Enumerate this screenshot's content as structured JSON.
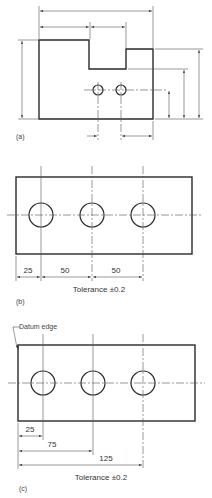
{
  "figure_a": {
    "label": "(a)",
    "description": "Stepped block with two holes, dimensions without values"
  },
  "figure_b": {
    "label": "(b)",
    "dimensions": [
      "25",
      "50",
      "50"
    ],
    "tolerance": "Tolerance ±0.2",
    "dimensioning_type": "chain"
  },
  "figure_c": {
    "label": "(c)",
    "datum_label": "Datum edge",
    "dimensions": [
      "25",
      "75",
      "125"
    ],
    "tolerance": "Tolerance ±0.2",
    "dimensioning_type": "datum"
  },
  "colors": {
    "line": "#2a2a2a",
    "thin_line": "#555555",
    "background": "#ffffff"
  }
}
